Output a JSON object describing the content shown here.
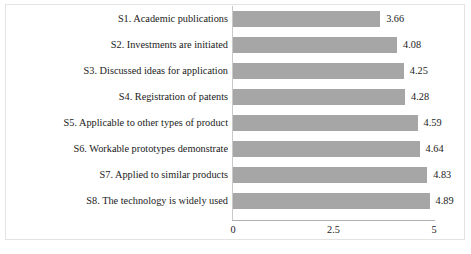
{
  "chart_data": {
    "type": "bar",
    "orientation": "horizontal",
    "title": "",
    "xlabel": "",
    "ylabel": "",
    "xlim": [
      0,
      5
    ],
    "grid": false,
    "legend": null,
    "bar_color": "#a6a6a6",
    "xticks": [
      "0",
      "2.5",
      "5"
    ],
    "xtick_values": [
      0,
      2.5,
      5
    ],
    "categories": [
      "S1. Academic publications",
      "S2. Investments are initiated",
      "S3. Discussed ideas for application",
      "S4. Registration of patents",
      "S5. Applicable to other types of product",
      "S6. Workable prototypes demonstrate",
      "S7. Applied to similar products",
      "S8. The technology is widely used"
    ],
    "values": [
      3.66,
      4.08,
      4.25,
      4.28,
      4.59,
      4.64,
      4.83,
      4.89
    ],
    "value_labels": [
      "3.66",
      "4.08",
      "4.25",
      "4.28",
      "4.59",
      "4.64",
      "4.83",
      "4.89"
    ]
  }
}
